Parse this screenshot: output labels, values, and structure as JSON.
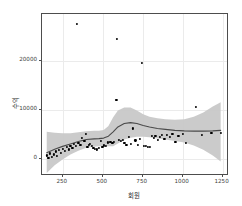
{
  "chart_data": {
    "type": "scatter",
    "title": "",
    "subtitle": "",
    "xlabel": "회원",
    "ylabel": "수익",
    "xlim": [
      120,
      1290
    ],
    "ylim": [
      -3500,
      29500
    ],
    "xticks": [
      250,
      500,
      750,
      1000,
      1250
    ],
    "yticks": [
      0,
      10000,
      20000
    ],
    "xtick_labels": [
      "250",
      "500",
      "750",
      "1000",
      "1250"
    ],
    "ytick_labels": [
      "0",
      "10000",
      "20000"
    ],
    "grid": true,
    "grid_color": "#ebebeb",
    "panel_background": "#ffffff",
    "panel_border_color": "#4d4d4d",
    "legend": "none",
    "point_color": "#000000",
    "smooth_line_color": "#4a4a4a",
    "ribbon_color": "#c8c8c8",
    "smooth_method": "loess",
    "series": [
      {
        "name": "observations",
        "points": [
          [
            152,
            700
          ],
          [
            160,
            250
          ],
          [
            170,
            1100
          ],
          [
            182,
            450
          ],
          [
            196,
            900
          ],
          [
            205,
            1500
          ],
          [
            215,
            600
          ],
          [
            228,
            1800
          ],
          [
            240,
            1200
          ],
          [
            252,
            2100
          ],
          [
            262,
            1600
          ],
          [
            275,
            2400
          ],
          [
            288,
            1900
          ],
          [
            298,
            2600
          ],
          [
            310,
            2200
          ],
          [
            322,
            3000
          ],
          [
            332,
            2700
          ],
          [
            340,
            27500
          ],
          [
            348,
            3300
          ],
          [
            360,
            2900
          ],
          [
            372,
            4200
          ],
          [
            385,
            3600
          ],
          [
            396,
            5100
          ],
          [
            404,
            2500
          ],
          [
            412,
            2800
          ],
          [
            420,
            3100
          ],
          [
            430,
            2600
          ],
          [
            442,
            2300
          ],
          [
            452,
            2050
          ],
          [
            462,
            1900
          ],
          [
            474,
            2150
          ],
          [
            486,
            3700
          ],
          [
            498,
            2400
          ],
          [
            508,
            2750
          ],
          [
            520,
            2600
          ],
          [
            534,
            3350
          ],
          [
            548,
            3500
          ],
          [
            560,
            3200
          ],
          [
            572,
            3400
          ],
          [
            585,
            12000
          ],
          [
            590,
            24500
          ],
          [
            600,
            3850
          ],
          [
            612,
            3700
          ],
          [
            624,
            3900
          ],
          [
            636,
            3250
          ],
          [
            648,
            2900
          ],
          [
            662,
            4500
          ],
          [
            676,
            3100
          ],
          [
            690,
            6200
          ],
          [
            704,
            3750
          ],
          [
            718,
            2800
          ],
          [
            732,
            4050
          ],
          [
            745,
            19500
          ],
          [
            758,
            2600
          ],
          [
            770,
            2700
          ],
          [
            782,
            2500
          ],
          [
            796,
            2450
          ],
          [
            806,
            4700
          ],
          [
            818,
            4300
          ],
          [
            830,
            4600
          ],
          [
            844,
            3900
          ],
          [
            858,
            4400
          ],
          [
            872,
            4800
          ],
          [
            886,
            4100
          ],
          [
            900,
            4900
          ],
          [
            918,
            4500
          ],
          [
            936,
            5100
          ],
          [
            955,
            3400
          ],
          [
            974,
            4750
          ],
          [
            1000,
            5000
          ],
          [
            1020,
            3300
          ],
          [
            1085,
            10500
          ],
          [
            1120,
            4900
          ],
          [
            1180,
            5200
          ],
          [
            1240,
            5250
          ]
        ]
      }
    ],
    "smooth_curve": [
      [
        150,
        900
      ],
      [
        200,
        1600
      ],
      [
        250,
        2200
      ],
      [
        300,
        2700
      ],
      [
        350,
        3200
      ],
      [
        400,
        3600
      ],
      [
        450,
        3750
      ],
      [
        480,
        3800
      ],
      [
        510,
        3900
      ],
      [
        540,
        4300
      ],
      [
        570,
        5200
      ],
      [
        600,
        6200
      ],
      [
        640,
        6900
      ],
      [
        680,
        7100
      ],
      [
        720,
        6900
      ],
      [
        760,
        6500
      ],
      [
        800,
        6200
      ],
      [
        850,
        5900
      ],
      [
        900,
        5700
      ],
      [
        960,
        5500
      ],
      [
        1020,
        5400
      ],
      [
        1080,
        5350
      ],
      [
        1140,
        5350
      ],
      [
        1200,
        5400
      ],
      [
        1250,
        5500
      ]
    ],
    "ribbon_upper": [
      [
        150,
        5200
      ],
      [
        200,
        5000
      ],
      [
        250,
        4900
      ],
      [
        300,
        4900
      ],
      [
        350,
        5100
      ],
      [
        400,
        5300
      ],
      [
        450,
        5400
      ],
      [
        480,
        5400
      ],
      [
        510,
        5600
      ],
      [
        540,
        6400
      ],
      [
        570,
        8200
      ],
      [
        600,
        9600
      ],
      [
        640,
        10200
      ],
      [
        680,
        10200
      ],
      [
        720,
        9600
      ],
      [
        760,
        8800
      ],
      [
        800,
        8300
      ],
      [
        850,
        8000
      ],
      [
        900,
        7800
      ],
      [
        960,
        7700
      ],
      [
        1020,
        7800
      ],
      [
        1080,
        8300
      ],
      [
        1140,
        9200
      ],
      [
        1200,
        10400
      ],
      [
        1250,
        11300
      ]
    ],
    "ribbon_lower": [
      [
        150,
        -3300
      ],
      [
        200,
        -1700
      ],
      [
        250,
        -500
      ],
      [
        300,
        500
      ],
      [
        350,
        1300
      ],
      [
        400,
        1900
      ],
      [
        450,
        2100
      ],
      [
        480,
        2200
      ],
      [
        510,
        2200
      ],
      [
        540,
        2200
      ],
      [
        570,
        2200
      ],
      [
        600,
        2800
      ],
      [
        640,
        3600
      ],
      [
        680,
        4000
      ],
      [
        720,
        4200
      ],
      [
        760,
        4200
      ],
      [
        800,
        4100
      ],
      [
        850,
        3800
      ],
      [
        900,
        3600
      ],
      [
        960,
        3300
      ],
      [
        1020,
        3000
      ],
      [
        1080,
        2400
      ],
      [
        1140,
        1500
      ],
      [
        1200,
        300
      ],
      [
        1250,
        -900
      ]
    ]
  }
}
